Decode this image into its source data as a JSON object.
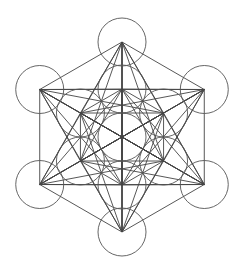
{
  "diagram": {
    "center": [
      122,
      137
    ],
    "circle_radius": 24,
    "inner_ring_distance": 48,
    "outer_ring_distance": 95,
    "stroke_color": "#555555",
    "background": "#ffffff",
    "circle_count": 13
  }
}
